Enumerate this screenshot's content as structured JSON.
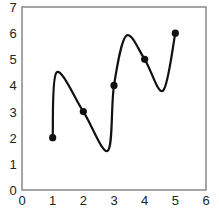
{
  "chart_data": {
    "type": "line",
    "title": "",
    "xlabel": "",
    "ylabel": "",
    "xlim": [
      0,
      6
    ],
    "ylim": [
      0,
      7
    ],
    "grid": false,
    "legend": null,
    "x_ticks": [
      "0",
      "1",
      "2",
      "3",
      "4",
      "5",
      "6"
    ],
    "y_ticks": [
      "0",
      "1",
      "2",
      "3",
      "4",
      "5",
      "6",
      "7"
    ],
    "series": [
      {
        "name": "points",
        "style": "markers",
        "x": [
          1,
          2,
          3,
          4,
          5
        ],
        "y": [
          2,
          3,
          4,
          5,
          6
        ]
      },
      {
        "name": "smooth-curve",
        "style": "curve",
        "description": "smooth oscillating spline through the points",
        "x": [
          1,
          1.13,
          2,
          2.8,
          3,
          3.4,
          4,
          4.6,
          5
        ],
        "y": [
          2,
          4.5,
          3,
          1.5,
          4,
          5.9,
          5,
          3.8,
          6
        ]
      }
    ],
    "colors": {
      "line": "#111111",
      "marker": "#111111",
      "axis": "#888888"
    }
  }
}
